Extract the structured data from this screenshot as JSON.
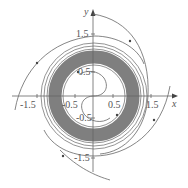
{
  "figure": {
    "type": "phase-portrait",
    "axes": {
      "x_label": "x",
      "y_label": "y",
      "x_ticks": [
        {
          "value": -1.5,
          "label": "-1.5"
        },
        {
          "value": -0.5,
          "label": "-0.5"
        },
        {
          "value": 0.5,
          "label": "0.5"
        },
        {
          "value": 1.5,
          "label": "1.5"
        }
      ],
      "y_ticks": [
        {
          "value": 1.5,
          "label": "1.5"
        },
        {
          "value": 0.5,
          "label": "0.5"
        },
        {
          "value": -0.5,
          "label": "-0.5"
        },
        {
          "value": -1.5,
          "label": "-1.5"
        }
      ],
      "range": [
        -2.4,
        2.4
      ]
    },
    "limit_cycle": {
      "inner_radius": 0.85,
      "outer_radius": 1.2,
      "color": "#7a7a7a"
    },
    "line_color": "#666666"
  }
}
